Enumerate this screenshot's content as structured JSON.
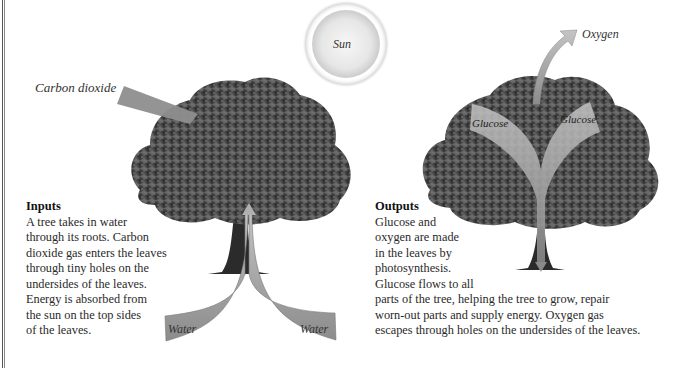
{
  "diagram": {
    "labels": {
      "carbon_dioxide": "Carbon dioxide",
      "sun": "Sun",
      "water_left": "Water",
      "water_right": "Water",
      "oxygen": "Oxygen",
      "glucose_left": "Glucose",
      "glucose_right": "Glucose"
    },
    "inputs": {
      "heading": "Inputs",
      "lines": [
        "A tree takes in water",
        "through its roots. Carbon",
        "dioxide gas enters the leaves",
        "through tiny holes on the",
        "undersides of the leaves.",
        "Energy is absorbed from",
        "the sun on the top sides",
        "of the leaves."
      ]
    },
    "outputs": {
      "heading": "Outputs",
      "lines": [
        "Glucose and",
        "oxygen are made",
        "in the leaves by",
        "photosynthesis.",
        "Glucose flows to all",
        "parts of the tree, helping the tree to grow, repair",
        "worn-out parts and supply energy. Oxygen gas",
        "escapes through holes on the undersides of the leaves."
      ]
    },
    "colors": {
      "arrow_fill": "#9a9a9a",
      "tree_foliage": "#3e3e3e",
      "sun_fill": "#e8e8e8"
    }
  }
}
